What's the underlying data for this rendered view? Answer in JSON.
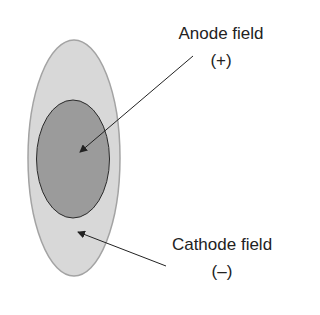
{
  "diagram": {
    "labels": {
      "anode_title": "Anode field",
      "anode_sign": "(+)",
      "cathode_title": "Cathode field",
      "cathode_sign": "(–)"
    },
    "colors": {
      "outer_fill": "#d8d8d8",
      "outer_stroke": "#a3a3a3",
      "inner_fill": "#9b9b9b",
      "inner_stroke": "#2a2a2a",
      "arrow": "#222222"
    }
  }
}
